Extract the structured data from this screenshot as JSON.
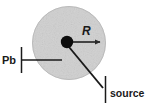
{
  "figure": {
    "background_color": "#ffffff",
    "line_color": "#1a1a1a",
    "shield": {
      "name": "lead-shield-sphere",
      "fill_color": "#c9c9c9",
      "edge_color": "#b5b5b5",
      "center_x": 69,
      "center_y": 43,
      "radius": 36.5,
      "texture": "speckled-gray"
    },
    "source_dot": {
      "name": "point-source-dot",
      "color": "#0d0d0d",
      "center_x": 67,
      "center_y": 42,
      "radius": 6.2
    },
    "radius_arrow": {
      "name": "radius-arrow",
      "x1": 70,
      "y1": 42,
      "x2": 101,
      "y2": 42,
      "color": "#2b2b2b"
    },
    "labels": {
      "shield": "Pb",
      "radius": "R",
      "source": "source"
    },
    "leaders": {
      "pb_tick": {
        "x": 21.5,
        "y1": 47,
        "y2": 73
      },
      "pb_line": {
        "x1": 21.5,
        "y1": 60,
        "x2": 62,
        "y2": 60
      },
      "source_tick": {
        "x": 105,
        "y1": 76,
        "y2": 103
      },
      "source_line": {
        "x1": 69,
        "y1": 47,
        "x2": 103,
        "y2": 88
      }
    }
  }
}
